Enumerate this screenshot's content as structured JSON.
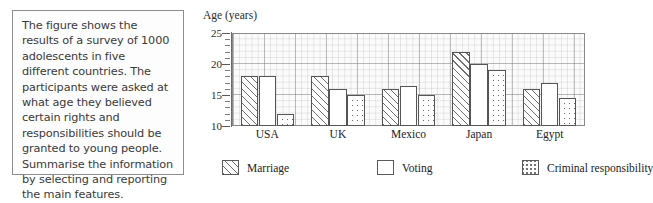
{
  "prompt": {
    "text": "The figure shows the results of a survey of 1000 adolescents in five different countries. The participants were asked at what age they believed certain rights and responsibilities should be granted to young people. Summarise the information by selecting and reporting the main features."
  },
  "chart_data": {
    "type": "bar",
    "title": "",
    "xlabel": "",
    "ylabel": "Age (years)",
    "ylim": [
      10,
      25
    ],
    "yticks": [
      10,
      15,
      20,
      25
    ],
    "ytick_labels": [
      "10",
      "15",
      "20",
      "25"
    ],
    "minor_tick_step": 1,
    "grid": true,
    "legend_position": "bottom",
    "categories": [
      "USA",
      "UK",
      "Mexico",
      "Japan",
      "Egypt"
    ],
    "series": [
      {
        "name": "Marriage",
        "pattern": "diagonal-hatch",
        "values": [
          18,
          18,
          16,
          22,
          16
        ]
      },
      {
        "name": "Voting",
        "pattern": "solid-white",
        "values": [
          18,
          16,
          16.5,
          20,
          17
        ]
      },
      {
        "name": "Criminal responsibility",
        "pattern": "dotted",
        "values": [
          12,
          15,
          15,
          19,
          14.5
        ]
      }
    ]
  }
}
